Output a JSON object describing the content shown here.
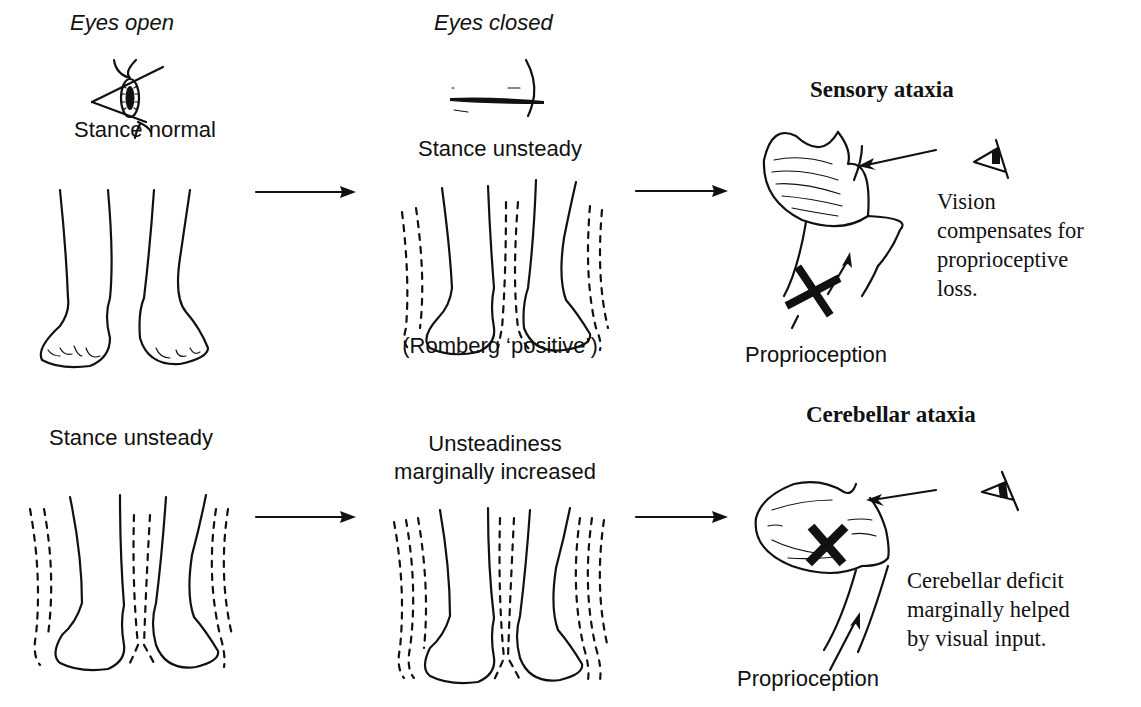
{
  "columns": {
    "eyes_open": "Eyes open",
    "eyes_closed": "Eyes closed"
  },
  "sensory_row": {
    "open_label": "Stance normal",
    "closed_label": "Stance unsteady",
    "romberg_note": "(Romberg ‘positive’)",
    "title": "Sensory ataxia",
    "explanation": [
      "Vision",
      "compensates for",
      "proprioceptive",
      "loss."
    ],
    "input_label": "Proprioception"
  },
  "cerebellar_row": {
    "open_label": "Stance unsteady",
    "closed_label": [
      "Unsteadiness",
      "marginally increased"
    ],
    "title": "Cerebellar ataxia",
    "explanation": [
      "Cerebellar deficit",
      "marginally helped",
      "by visual input."
    ],
    "input_label": "Proprioception"
  },
  "icons": {
    "open_eye": "open-eye-icon",
    "closed_eye": "closed-eye-icon",
    "arrow": "arrow-right-icon",
    "lesion": "x-mark-icon",
    "brain": "cerebellum-icon",
    "feet": "feet-icon"
  },
  "colors": {
    "ink": "#111111",
    "paper": "#ffffff"
  }
}
